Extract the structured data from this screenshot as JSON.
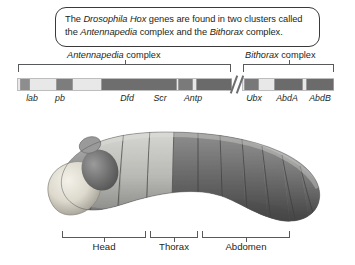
{
  "caption": {
    "line1_pre": "The ",
    "line1_italic1": "Drosophila Hox",
    "line1_mid": " genes are found in two clusters called",
    "line2_pre": "the ",
    "line2_italic1": "Antennapedia",
    "line2_mid": " complex and the ",
    "line2_italic2": "Bithorax",
    "line2_post": " complex."
  },
  "complexes": [
    {
      "id": "antennapedia",
      "italic": "Antennapedia",
      "suffix": " complex"
    },
    {
      "id": "bithorax",
      "italic": "Bithorax",
      "suffix": " complex"
    }
  ],
  "gene_clusters": {
    "left": {
      "name": "Antennapedia complex",
      "genes": [
        {
          "label": "lab",
          "label_x": 32,
          "block_left": 2,
          "block_width": 9,
          "color": "#8d8d8d"
        },
        {
          "label": "pb",
          "label_x": 60,
          "block_left": 38,
          "block_width": 16,
          "color": "#7d7d7d"
        },
        {
          "label": "Dfd",
          "label_x": 127,
          "block_left": 83,
          "block_width": 75,
          "color": "#6e6e6e"
        },
        {
          "label": "Scr",
          "label_x": 160,
          "block_left": 160,
          "block_width": 14,
          "color": "#7a7a7a"
        },
        {
          "label": "Antp",
          "label_x": 193,
          "block_left": 178,
          "block_width": 35,
          "color": "#6a6a6a"
        }
      ]
    },
    "right": {
      "name": "Bithorax complex",
      "genes": [
        {
          "label": "Ubx",
          "label_x": 254,
          "block_left": 1,
          "block_width": 14,
          "color": "#787878"
        },
        {
          "label": "AbdA",
          "label_x": 287,
          "block_left": 31,
          "block_width": 28,
          "color": "#6b6b6b"
        },
        {
          "label": "AbdB",
          "label_x": 320,
          "block_left": 63,
          "block_width": 27,
          "color": "#6b6b6b"
        }
      ]
    }
  },
  "body_regions": [
    {
      "id": "head",
      "label": "Head",
      "label_x": 104
    },
    {
      "id": "thorax",
      "label": "Thorax",
      "label_x": 174
    },
    {
      "id": "abdomen",
      "label": "Abdomen",
      "label_x": 246
    }
  ],
  "colors": {
    "bar_background": "#e8e8e8",
    "bracket": "#58595b",
    "text": "#231f20",
    "box_border": "#3a3a3a"
  }
}
